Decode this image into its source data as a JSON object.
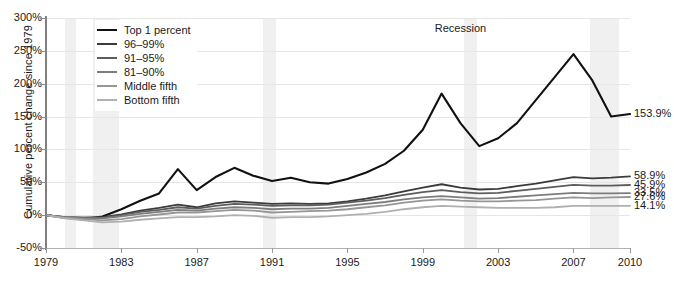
{
  "chart_data": {
    "type": "line",
    "title": "",
    "xlabel": "",
    "ylabel": "Cumulative percent change since 1979",
    "xlim": [
      1979,
      2010
    ],
    "ylim": [
      -50,
      300
    ],
    "ytick_labels": [
      "300%",
      "250%",
      "200%",
      "150%",
      "100%",
      "50%",
      "0%",
      "-50%"
    ],
    "ytick_values": [
      300,
      250,
      200,
      150,
      100,
      50,
      0,
      -50
    ],
    "xtick_labels": [
      "1979",
      "1983",
      "1987",
      "1991",
      "1995",
      "1999",
      "2003",
      "2007",
      "2010"
    ],
    "xtick_values": [
      1979,
      1983,
      1987,
      1991,
      1995,
      1999,
      2003,
      2007,
      2010
    ],
    "grid": true,
    "legend_position": "top-left",
    "annotations": [
      {
        "text": "Recession",
        "x": 2001,
        "y": 285
      }
    ],
    "recession_bands": [
      {
        "start": 1980.0,
        "end": 1980.6
      },
      {
        "start": 1981.5,
        "end": 1982.9
      },
      {
        "start": 1990.5,
        "end": 1991.2
      },
      {
        "start": 2001.2,
        "end": 2001.9
      },
      {
        "start": 2007.9,
        "end": 2009.4
      }
    ],
    "x": [
      1979,
      1980,
      1981,
      1982,
      1983,
      1984,
      1985,
      1986,
      1987,
      1988,
      1989,
      1990,
      1991,
      1992,
      1993,
      1994,
      1995,
      1996,
      1997,
      1998,
      1999,
      2000,
      2001,
      2002,
      2003,
      2004,
      2005,
      2006,
      2007,
      2008,
      2009,
      2010
    ],
    "series": [
      {
        "name": "Top 1 percent",
        "color": "#111111",
        "width": 2.1,
        "end_label": "153.9%",
        "end_value": 153.9,
        "values": [
          0,
          -4,
          -6,
          -2,
          9,
          22,
          33,
          70,
          38,
          58,
          72,
          60,
          52,
          57,
          50,
          48,
          55,
          65,
          78,
          98,
          130,
          185,
          140,
          105,
          117,
          140,
          175,
          210,
          245,
          205,
          150,
          153.9
        ]
      },
      {
        "name": "96–99%",
        "color": "#3b3b3b",
        "width": 1.8,
        "end_label": "58.9%",
        "end_value": 58.9,
        "values": [
          0,
          -3,
          -4,
          -3,
          1,
          7,
          11,
          16,
          12,
          18,
          21,
          19,
          17,
          18,
          17,
          18,
          21,
          25,
          30,
          36,
          42,
          47,
          42,
          39,
          40,
          44,
          48,
          53,
          58,
          56,
          57,
          58.9
        ]
      },
      {
        "name": "91–95%",
        "color": "#5d5d5d",
        "width": 1.8,
        "end_label": "45.9%",
        "end_value": 45.9,
        "values": [
          0,
          -3,
          -4,
          -4,
          0,
          5,
          8,
          12,
          10,
          14,
          17,
          16,
          14,
          15,
          15,
          16,
          19,
          22,
          26,
          31,
          35,
          38,
          35,
          33,
          34,
          37,
          40,
          43,
          46,
          45,
          45,
          45.9
        ]
      },
      {
        "name": "81–90%",
        "color": "#7d7d7d",
        "width": 1.8,
        "end_label": "33.5%",
        "end_value": 33.5,
        "values": [
          0,
          -3,
          -5,
          -5,
          -2,
          2,
          5,
          8,
          7,
          10,
          12,
          11,
          9,
          10,
          10,
          11,
          14,
          17,
          20,
          24,
          27,
          29,
          27,
          25,
          26,
          28,
          30,
          32,
          34,
          33,
          33,
          33.5
        ]
      },
      {
        "name": "Middle fifth",
        "color": "#969696",
        "width": 1.8,
        "end_label": "27.6%",
        "end_value": 27.6,
        "values": [
          0,
          -4,
          -6,
          -8,
          -6,
          -2,
          1,
          4,
          4,
          6,
          8,
          7,
          4,
          5,
          6,
          7,
          9,
          12,
          15,
          19,
          22,
          24,
          22,
          21,
          21,
          22,
          23,
          25,
          27,
          26,
          27,
          27.6
        ]
      },
      {
        "name": "Bottom fifth",
        "color": "#b0b0b0",
        "width": 1.8,
        "end_label": "14.1%",
        "end_value": 14.1,
        "values": [
          0,
          -5,
          -8,
          -11,
          -10,
          -7,
          -5,
          -3,
          -3,
          -2,
          0,
          -1,
          -4,
          -3,
          -3,
          -2,
          0,
          2,
          5,
          9,
          12,
          14,
          13,
          12,
          11,
          11,
          11,
          12,
          14,
          14,
          14,
          14.1
        ]
      }
    ]
  }
}
